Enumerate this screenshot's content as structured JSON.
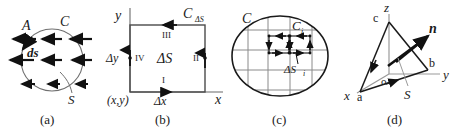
{
  "figure": {
    "background": "#ffffff",
    "ink": "#1a1a1a",
    "grid_color": "#8a8a8a",
    "axis_color": "#7a7a7a"
  },
  "captions": {
    "a": "(a)",
    "b": "(b)",
    "c": "(c)",
    "d": "(d)"
  },
  "panel_a": {
    "title": "circulation-around-closed-curve",
    "labels": {
      "vector_field": "A",
      "curve": "C",
      "line_element": "ds",
      "surface": "S"
    },
    "arrow_rows": 3,
    "arrow_direction": "left"
  },
  "panel_b": {
    "title": "differential-rectangle-in-xy-plane",
    "labels": {
      "axis_y": "y",
      "axis_x": "x",
      "contour": "C",
      "contour_sub": "ΔS",
      "area": "ΔS",
      "side_bottom": "I",
      "side_right": "II",
      "side_top": "III",
      "side_left": "IV",
      "delta_y": "Δy",
      "delta_x": "Δx",
      "origin_point": "(x,y)"
    }
  },
  "panel_c": {
    "title": "surface-subdivided-into-cells",
    "labels": {
      "outer_contour": "C",
      "cell_contour": "C",
      "cell_contour_sub": "i",
      "cell_area": "ΔS",
      "cell_area_sub": "i"
    },
    "grid_vertical_lines": 4,
    "grid_horizontal_lines": 4
  },
  "panel_d": {
    "title": "tetrahedron-with-normal-vector",
    "labels": {
      "axis_x": "x",
      "axis_y": "y",
      "axis_z": "z",
      "vertex_a": "a",
      "vertex_b": "b",
      "vertex_c": "c",
      "origin": "o",
      "normal": "n",
      "surface": "S"
    }
  }
}
